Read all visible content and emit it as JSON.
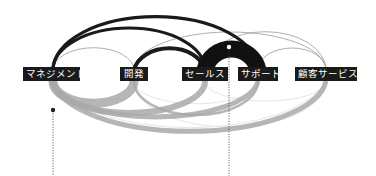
{
  "diagram": {
    "type": "arc-relationship-diagram",
    "nodes": [
      {
        "id": "mgmt",
        "label": "マネジメント",
        "x": 53
      },
      {
        "id": "dev",
        "label": "開発",
        "x": 134
      },
      {
        "id": "sales",
        "label": "セールス",
        "x": 205
      },
      {
        "id": "support",
        "label": "サポート",
        "x": 258
      },
      {
        "id": "cs",
        "label": "顧客サービス",
        "x": 326
      }
    ],
    "colors": {
      "label_bg": "#1a1a1a",
      "label_text": "#ffffff",
      "strong_arc": "#1a1a1a",
      "weak_arc_top": "#b0b0b0",
      "lower_arc": "#a8a8a8",
      "faint_arc": "#e4e4e4",
      "dotted_line": "#444444"
    }
  }
}
